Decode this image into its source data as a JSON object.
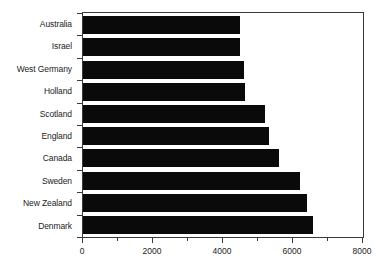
{
  "chart_data": {
    "type": "bar",
    "orientation": "horizontal",
    "title": "",
    "subtitle": "",
    "xlabel": "",
    "ylabel": "",
    "categories": [
      "Australia",
      "Israel",
      "West Germany",
      "Holland",
      "Scotland",
      "England",
      "Canada",
      "Sweden",
      "New Zealand",
      "Denmark"
    ],
    "values": [
      4480,
      4480,
      4600,
      4620,
      5190,
      5300,
      5590,
      6210,
      6410,
      6580
    ],
    "xlim": [
      0,
      8000
    ],
    "xticks": [
      0,
      2000,
      4000,
      6000,
      8000
    ],
    "xtick_labels": [
      "0",
      "2000",
      "4000",
      "6000",
      "8000"
    ],
    "x_minor_tick_interval": 1000,
    "grid": false,
    "legend": null,
    "bar_color": "#0a0a0a",
    "axis_color": "#3a3a3a",
    "background_color": "#ffffff"
  }
}
